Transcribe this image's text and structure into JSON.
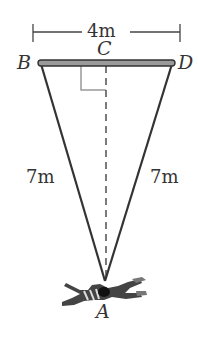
{
  "diagram": {
    "type": "parachute-geometry",
    "points": {
      "B": "B",
      "C": "C",
      "D": "D",
      "A": "A"
    },
    "measurements": {
      "top_width": "4m",
      "left_side": "7m",
      "right_side": "7m"
    },
    "colors": {
      "line": "#333333",
      "right_angle": "#888888",
      "bar": "#555555"
    }
  }
}
